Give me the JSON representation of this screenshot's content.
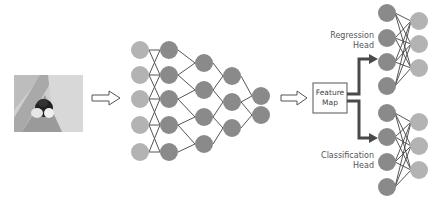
{
  "diagram": {
    "input": {
      "label": "input-image",
      "description": "photo of a dog on a floor"
    },
    "feature_map": {
      "line1": "Feature",
      "line2": "Map"
    },
    "heads": {
      "regression": {
        "line1": "Regression",
        "line2": "Head"
      },
      "classification": {
        "line1": "Classification",
        "line2": "Head"
      }
    },
    "backbone_layers": [
      5,
      5,
      4,
      3,
      2
    ],
    "head_layers": [
      4,
      3
    ],
    "colors": {
      "light_node": "#b3b3b3",
      "dark_node": "#8a8a8a",
      "edge": "#555555",
      "thick_arrow": "#4a4a4a"
    }
  }
}
